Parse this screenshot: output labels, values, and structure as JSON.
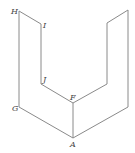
{
  "diagram": {
    "type": "3d-solid-line-drawing",
    "line_color": "#8a8a8a",
    "label_color": "#444444",
    "vertices": {
      "H": {
        "x": 19,
        "y": 11,
        "label": "H"
      },
      "I": {
        "x": 41,
        "y": 24,
        "label": "I"
      },
      "J": {
        "x": 41,
        "y": 84,
        "label": "J"
      },
      "F": {
        "x": 73,
        "y": 103,
        "label": "F"
      },
      "A": {
        "x": 73,
        "y": 138,
        "label": "A"
      },
      "G": {
        "x": 19,
        "y": 107,
        "label": "G"
      },
      "P1": {
        "x": 128,
        "y": 10,
        "label": ""
      },
      "P2": {
        "x": 107,
        "y": 23,
        "label": ""
      },
      "P3": {
        "x": 107,
        "y": 84,
        "label": ""
      },
      "P4": {
        "x": 128,
        "y": 107,
        "label": ""
      }
    },
    "labels": [
      {
        "text": "H",
        "x": 11,
        "y": 14
      },
      {
        "text": "I",
        "x": 43,
        "y": 28
      },
      {
        "text": "J",
        "x": 43,
        "y": 82
      },
      {
        "text": "F",
        "x": 70,
        "y": 100
      },
      {
        "text": "G",
        "x": 12,
        "y": 111
      },
      {
        "text": "A",
        "x": 70,
        "y": 147
      }
    ]
  }
}
